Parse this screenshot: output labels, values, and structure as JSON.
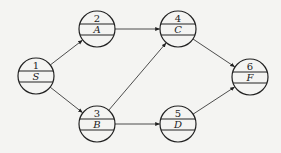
{
  "diagram": {
    "type": "activity-network",
    "nodes": [
      {
        "id": "1",
        "number": "1",
        "label": "S",
        "cx": 36,
        "cy": 76
      },
      {
        "id": "2",
        "number": "2",
        "label": "A",
        "cx": 97,
        "cy": 29
      },
      {
        "id": "3",
        "number": "3",
        "label": "B",
        "cx": 97,
        "cy": 124
      },
      {
        "id": "4",
        "number": "4",
        "label": "C",
        "cx": 178,
        "cy": 29
      },
      {
        "id": "5",
        "number": "5",
        "label": "D",
        "cx": 178,
        "cy": 124
      },
      {
        "id": "6",
        "number": "6",
        "label": "F",
        "cx": 250,
        "cy": 77
      }
    ],
    "edges": [
      {
        "from": "1",
        "to": "2"
      },
      {
        "from": "1",
        "to": "3"
      },
      {
        "from": "2",
        "to": "4"
      },
      {
        "from": "3",
        "to": "4"
      },
      {
        "from": "3",
        "to": "5"
      },
      {
        "from": "4",
        "to": "6"
      },
      {
        "from": "5",
        "to": "6"
      }
    ],
    "colors": {
      "stroke": "#222222",
      "background": "#f4f4f2"
    }
  }
}
